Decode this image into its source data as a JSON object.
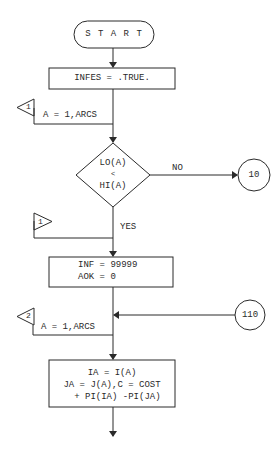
{
  "flowchart": {
    "start": {
      "label": "S T A R T"
    },
    "init": {
      "label": "INFES = .TRUE."
    },
    "loop1": {
      "marker": "1",
      "range": "A = 1,ARCS"
    },
    "decision": {
      "line1": "LO(A)",
      "line2": "<",
      "line3": "HI(A)",
      "no_label": "NO",
      "yes_label": "YES"
    },
    "connector_10": {
      "label": "10"
    },
    "loop1_end": {
      "marker": "1"
    },
    "assign": {
      "line1": "INF = 99999",
      "line2": "AOK = 0"
    },
    "connector_110": {
      "label": "110"
    },
    "loop2": {
      "marker": "2",
      "range": "A = 1,ARCS"
    },
    "compute": {
      "line1": "IA = I(A)",
      "line2": "JA = J(A),C = COST",
      "line3": "  + PI(IA) -PI(JA)"
    }
  },
  "colors": {
    "ink": "#2a2a2a",
    "background": "#ffffff"
  }
}
